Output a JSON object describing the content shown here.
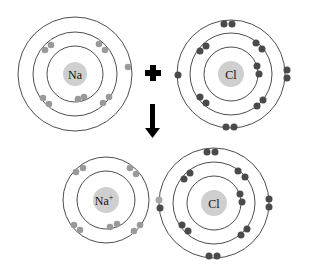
{
  "diagram": {
    "reactants": {
      "sodium": {
        "label": "Na",
        "shells": [
          2,
          8,
          1
        ],
        "electron_color": "#9a9a9a"
      },
      "chlorine": {
        "label": "Cl",
        "shells": [
          2,
          8,
          7
        ],
        "electron_color": "#4a4a4a"
      }
    },
    "operator": {
      "plus": "plus-sign",
      "arrow": "down-arrow"
    },
    "products": {
      "sodium_ion": {
        "label": "Na",
        "charge": "+",
        "shells": [
          2,
          8
        ],
        "electron_color": "#9a9a9a"
      },
      "chloride_ion": {
        "label": "Cl",
        "shells": [
          2,
          8,
          8
        ],
        "transferred_electron_color": "#a8a8a8",
        "electron_color": "#4a4a4a"
      }
    },
    "colors": {
      "nucleus": "#cfcfcf",
      "orbit": "#3a3a3a",
      "symbol": "#000000"
    }
  }
}
